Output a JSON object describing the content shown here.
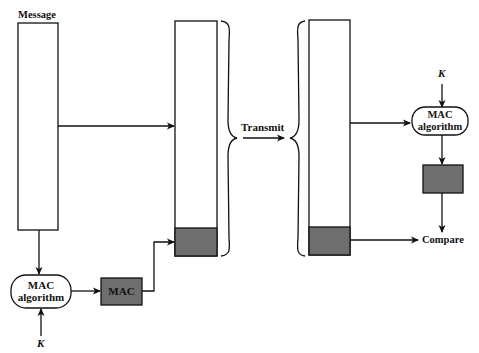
{
  "diagram": {
    "type": "MAC authentication flow",
    "colors": {
      "stroke": "#111111",
      "mac_fill": "#6e6e6e",
      "background": "#ffffff"
    },
    "sender": {
      "message_label": "Message",
      "mac_algorithm": {
        "line1": "MAC",
        "line2": "algorithm"
      },
      "key_label": "K",
      "mac_box_label": "MAC"
    },
    "channel": {
      "transmit_label": "Transmit"
    },
    "receiver": {
      "key_label": "K",
      "mac_algorithm": {
        "line1": "MAC",
        "line2": "algorithm"
      },
      "compare_label": "Compare"
    }
  }
}
